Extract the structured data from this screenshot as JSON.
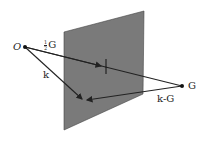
{
  "diagram": {
    "type": "vector geometry diagram: Bragg plane bisecting reciprocal lattice vector",
    "colors": {
      "plane_fill": "#7a7a7a",
      "plane_edge": "#444444",
      "line": "#222222",
      "background": "#ffffff"
    },
    "plane": {
      "points": "64,32 144,11 143,94 64,130"
    },
    "points": {
      "origin": {
        "label": "O",
        "x": 25,
        "y": 47
      },
      "G": {
        "label": "G",
        "x": 182,
        "y": 86
      }
    },
    "vectors": {
      "half_G": {
        "label_num": "1",
        "label_den": "2",
        "label_sym": "G",
        "from": [
          25,
          47
        ],
        "to": [
          103,
          66
        ]
      },
      "k": {
        "label": "k",
        "from": [
          25,
          47
        ],
        "to": [
          82,
          99
        ]
      },
      "k_minus_G": {
        "label": "k-G",
        "from": [
          182,
          86
        ],
        "to": [
          86,
          100
        ]
      },
      "G_line": {
        "from": [
          25,
          47
        ],
        "to": [
          182,
          86
        ]
      }
    },
    "labels": {
      "O": "O",
      "G": "G",
      "k": "k",
      "k_minus_G": "k-G",
      "half_num": "1",
      "half_den": "2",
      "half_G_sym": "G"
    }
  }
}
